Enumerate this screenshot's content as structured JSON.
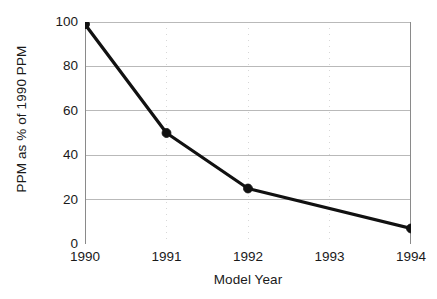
{
  "chart_data": {
    "type": "line",
    "title": "",
    "xlabel": "Model Year",
    "ylabel": "PPM as % of 1990 PPM",
    "x": [
      1990,
      1991,
      1992,
      1994
    ],
    "values": [
      99,
      50,
      25,
      7
    ],
    "series": [
      {
        "name": "PPM as % of 1990 PPM",
        "x": [
          1990,
          1991,
          1992,
          1994
        ],
        "values": [
          99,
          50,
          25,
          7
        ]
      }
    ],
    "xlim": [
      1990,
      1994
    ],
    "ylim": [
      0,
      100
    ],
    "x_tick_labels": [
      "1990",
      "1991",
      "1992",
      "1993",
      "1994"
    ],
    "x_ticks": [
      1990,
      1991,
      1992,
      1993,
      1994
    ],
    "y_tick_labels": [
      "0",
      "20",
      "40",
      "60",
      "80",
      "100"
    ],
    "y_ticks": [
      0,
      20,
      40,
      60,
      80,
      100
    ],
    "grid": true,
    "grid_orientation": "horizontal-and-vertical",
    "legend": false,
    "legend_position": "none",
    "markers": "filled-circle",
    "annotations": []
  },
  "style": {
    "line_color": "#111111",
    "marker_color": "#111111",
    "grid_color": "#b9b9b9",
    "vertical_grid_color": "#d8d8d8",
    "axis_color": "#8a8a8a",
    "background_color": "#ffffff",
    "text_color": "#1a1a1a"
  },
  "axes": {
    "y_title": "PPM as % of 1990 PPM",
    "x_title": "Model Year"
  }
}
